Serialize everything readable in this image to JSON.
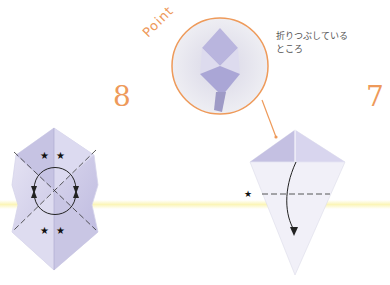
{
  "diagram": {
    "steps": [
      {
        "number": "8",
        "label_position": "left",
        "description": "Squash-fold shape with diagonal fold lines, circular rotation arrows, and four star markers"
      },
      {
        "number": "7",
        "label_position": "right",
        "description": "Kite shape with dashed valley-fold line, star marker, and downward fold arrow"
      }
    ],
    "callout": {
      "title": "Point",
      "caption_lines": [
        "折りつぶしている",
        "ところ"
      ]
    },
    "markers": {
      "star": "★"
    },
    "colors": {
      "accent": "#ee9a5a",
      "paper": "#c9c6e6",
      "paper_light": "#e6e4f3",
      "line": "#333333",
      "band": "#fbf5b8"
    }
  }
}
